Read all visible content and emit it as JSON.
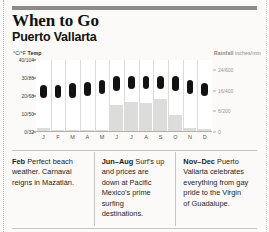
{
  "header": {
    "title": "When to Go",
    "subtitle": "Puerto Vallarta"
  },
  "axes": {
    "temp_caption_unit": "°C/°F ",
    "temp_caption_label": "Temp",
    "rain_caption_label": "Rainfall ",
    "rain_caption_unit": "inches/mm"
  },
  "chart_data": {
    "type": "bar",
    "categories": [
      "J",
      "F",
      "M",
      "A",
      "M",
      "J",
      "J",
      "A",
      "S",
      "O",
      "N",
      "D"
    ],
    "months_full": [
      "January",
      "February",
      "March",
      "April",
      "May",
      "June",
      "July",
      "August",
      "September",
      "October",
      "November",
      "December"
    ],
    "xlabel": "",
    "grid": false,
    "legend": "none",
    "series": [
      {
        "name": "Temp",
        "type": "range-bar",
        "unit": "°C",
        "ylabel": "°C/°F Temp",
        "ylim": [
          0,
          40
        ],
        "yticks": [
          0,
          10,
          20,
          30,
          40
        ],
        "ytick_labels": [
          "0/32",
          "10/50",
          "20/68",
          "30/86",
          "40/104"
        ],
        "axis": "left",
        "low": [
          19,
          19,
          19,
          20,
          21,
          23,
          24,
          24,
          24,
          23,
          21,
          20
        ],
        "high": [
          26,
          26,
          27,
          28,
          29,
          31,
          31,
          31,
          31,
          31,
          29,
          27
        ]
      },
      {
        "name": "Rainfall",
        "type": "bar",
        "unit": "mm",
        "ylabel": "Rainfall inches/mm",
        "ylim": [
          0,
          700
        ],
        "yticks": [
          0,
          200,
          400,
          600
        ],
        "ytick_labels": [
          "0",
          "8/200",
          "16/400",
          "24/600"
        ],
        "axis": "right",
        "values": [
          25,
          10,
          5,
          5,
          10,
          250,
          280,
          270,
          310,
          160,
          30,
          20
        ]
      }
    ]
  },
  "notes": [
    {
      "period": "Feb",
      "text": " Perfect beach weather. Carnaval reigns in Mazatlán."
    },
    {
      "period": "Jun–Aug",
      "text": " Surf's up and prices are down at Pacific Mexico's prime surfing destinations."
    },
    {
      "period": "Nov–Dec",
      "text": " Puerto Vallarta celebrates everything from gay pride to the Virgin of Guadalupe."
    }
  ]
}
